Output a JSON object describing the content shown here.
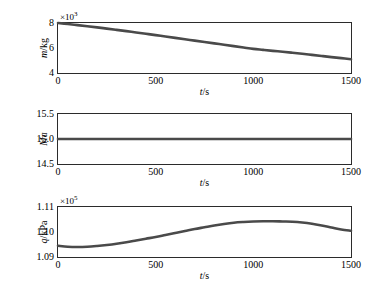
{
  "figure": {
    "background": "#ffffff",
    "curve_color": "#4a4a4a",
    "axis_color": "#2b2b2b"
  },
  "panels": [
    {
      "name": "mass",
      "ylabel_var": "m",
      "ylabel_unit": "/kg",
      "xlabel_var": "t",
      "xlabel_unit": "/s",
      "exponent_text": "×10",
      "exponent_power": "3",
      "yticks": [
        "4",
        "6",
        "8"
      ],
      "xticks": [
        "0",
        "500",
        "1000",
        "1500"
      ]
    },
    {
      "name": "mach",
      "ylabel_var": "Ma",
      "ylabel_unit": "",
      "xlabel_var": "t",
      "xlabel_unit": "/s",
      "exponent_text": "",
      "exponent_power": "",
      "yticks": [
        "14.5",
        "15.0",
        "15.5"
      ],
      "xticks": [
        "0",
        "500",
        "1000",
        "1500"
      ]
    },
    {
      "name": "dynamic-pressure",
      "ylabel_var": "q",
      "ylabel_unit": "/kPa",
      "xlabel_var": "t",
      "xlabel_unit": "/s",
      "exponent_text": "×10",
      "exponent_power": "5",
      "yticks": [
        "1.09",
        "1.10",
        "1.11"
      ],
      "xticks": [
        "0",
        "500",
        "1000",
        "1500"
      ]
    }
  ],
  "chart_data": [
    {
      "type": "line",
      "title": "",
      "xlabel": "t/s",
      "ylabel": "m/kg",
      "y_multiplier": 1000,
      "xlim": [
        0,
        1500
      ],
      "ylim": [
        4,
        8
      ],
      "grid": false,
      "legend": null,
      "x": [
        0,
        50,
        100,
        150,
        200,
        250,
        300,
        350,
        400,
        450,
        500,
        550,
        600,
        650,
        700,
        750,
        800,
        850,
        900,
        950,
        1000,
        1050,
        1100,
        1150,
        1200,
        1250,
        1300,
        1350,
        1400,
        1450,
        1500
      ],
      "values": [
        8.0,
        7.92,
        7.83,
        7.74,
        7.65,
        7.55,
        7.45,
        7.35,
        7.24,
        7.14,
        7.03,
        6.92,
        6.81,
        6.7,
        6.59,
        6.48,
        6.37,
        6.26,
        6.15,
        6.04,
        5.93,
        5.85,
        5.77,
        5.7,
        5.62,
        5.54,
        5.45,
        5.36,
        5.27,
        5.19,
        5.1
      ]
    },
    {
      "type": "line",
      "title": "",
      "xlabel": "t/s",
      "ylabel": "Ma",
      "y_multiplier": 1,
      "xlim": [
        0,
        1500
      ],
      "ylim": [
        14.5,
        15.5
      ],
      "grid": false,
      "legend": null,
      "x": [
        0,
        100,
        200,
        300,
        400,
        500,
        600,
        700,
        800,
        900,
        1000,
        1100,
        1200,
        1300,
        1400,
        1500
      ],
      "values": [
        15.0,
        15.0,
        15.0,
        15.0,
        15.0,
        15.0,
        15.0,
        15.0,
        15.0,
        15.0,
        15.0,
        15.0,
        15.0,
        15.0,
        15.0,
        15.0
      ]
    },
    {
      "type": "line",
      "title": "",
      "xlabel": "t/s",
      "ylabel": "q/kPa",
      "y_multiplier": 100000,
      "xlim": [
        0,
        1500
      ],
      "ylim": [
        1.09,
        1.11
      ],
      "grid": false,
      "legend": null,
      "x": [
        0,
        50,
        100,
        150,
        200,
        250,
        300,
        350,
        400,
        450,
        500,
        550,
        600,
        650,
        700,
        750,
        800,
        850,
        900,
        950,
        1000,
        1050,
        1100,
        1150,
        1200,
        1250,
        1300,
        1350,
        1400,
        1450,
        1500
      ],
      "values": [
        1.0945,
        1.0941,
        1.094,
        1.0941,
        1.0944,
        1.0948,
        1.0953,
        1.0959,
        1.0966,
        1.0973,
        1.098,
        1.0988,
        1.0996,
        1.1004,
        1.1012,
        1.1019,
        1.1026,
        1.1032,
        1.1037,
        1.104,
        1.1042,
        1.1043,
        1.1043,
        1.1042,
        1.1041,
        1.1038,
        1.1033,
        1.1026,
        1.1018,
        1.101,
        1.1005
      ]
    }
  ]
}
